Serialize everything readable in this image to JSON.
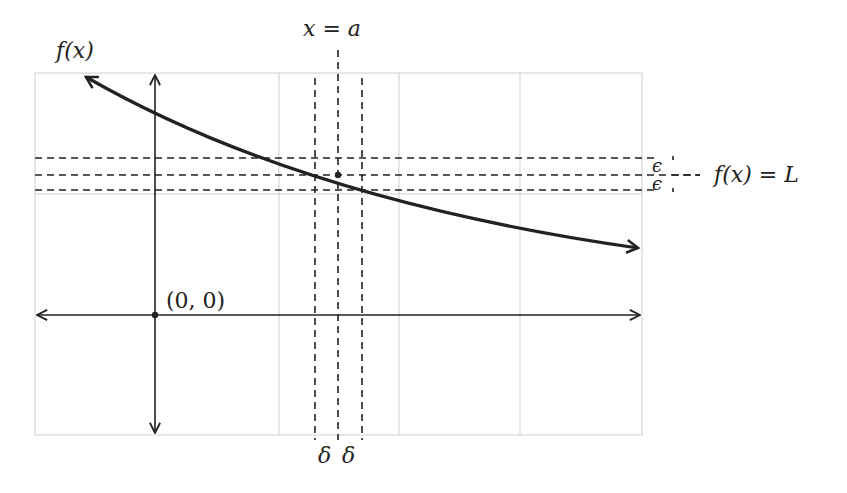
{
  "diagram": {
    "labels": {
      "y_axis": "f(x)",
      "vertical_line": "x = a",
      "horizontal_line": "f(x) = L",
      "origin": "(0, 0)",
      "epsilon_upper": "ϵ",
      "epsilon_lower": "ϵ",
      "delta_left": "δ",
      "delta_right": "δ"
    },
    "grid": {
      "x_lines": [
        35,
        155,
        279,
        399,
        520,
        642
      ],
      "y_lines": [
        73,
        194,
        315,
        435
      ],
      "color": "#cfcfcf"
    },
    "axes": {
      "origin_px": [
        155,
        315
      ],
      "color": "#222222"
    },
    "limit_point_px": [
      338,
      175
    ],
    "epsilon_band_px": {
      "upper": 158,
      "center": 175,
      "lower": 190
    },
    "delta_band_px": {
      "left": 315,
      "center": 338,
      "right": 362
    },
    "curve": {
      "description": "Decreasing concave-up curve with arrows at both ends",
      "path": "M 84 76 Q 300 200 640 250"
    }
  }
}
